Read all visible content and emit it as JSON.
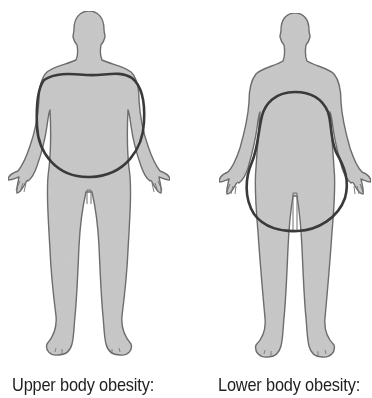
{
  "figure": {
    "panels": [
      {
        "id": "upper",
        "label": "Upper body obesity:",
        "body_type": "male silhouette",
        "highlight_shape": "circle around upper torso (apple)"
      },
      {
        "id": "lower",
        "label": "Lower body obesity:",
        "body_type": "female silhouette",
        "highlight_shape": "pear-shaped loop around hips and thighs"
      }
    ],
    "colors": {
      "body_fill": "#c8c8c8",
      "body_outline": "#6e6e6e",
      "highlight_stroke": "#3a3a3a",
      "background": "#ffffff",
      "text": "#1e1e1e"
    }
  }
}
